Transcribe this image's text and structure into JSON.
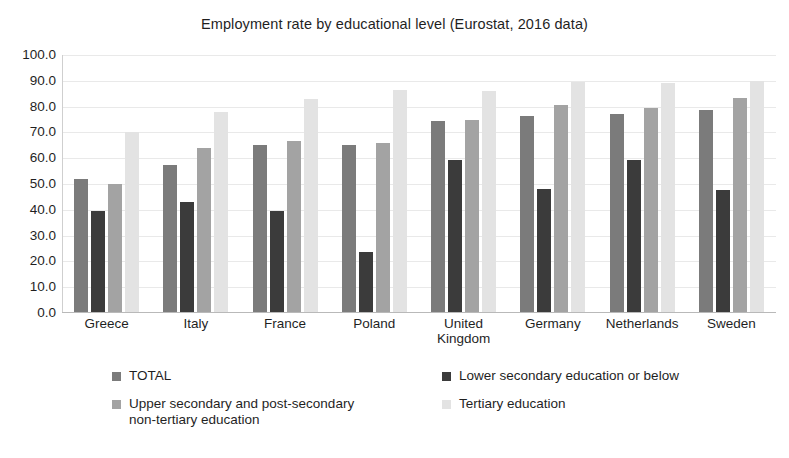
{
  "chart_data": {
    "type": "bar",
    "title": "Employment rate by educational level (Eurostat, 2016 data)",
    "xlabel": "",
    "ylabel": "",
    "ylim": [
      0,
      100
    ],
    "ytick_labels": [
      "100.0",
      "90.0",
      "80.0",
      "70.0",
      "60.0",
      "50.0",
      "40.0",
      "30.0",
      "20.0",
      "10.0",
      "0.0"
    ],
    "ytick_values": [
      100,
      90,
      80,
      70,
      60,
      50,
      40,
      30,
      20,
      10,
      0
    ],
    "grid": true,
    "legend_position": "bottom",
    "categories": [
      "Greece",
      "Italy",
      "France",
      "Poland",
      "United Kingdom",
      "Germany",
      "Netherlands",
      "Sweden"
    ],
    "category_lines": [
      [
        "Greece"
      ],
      [
        "Italy"
      ],
      [
        "France"
      ],
      [
        "Poland"
      ],
      [
        "United",
        "Kingdom"
      ],
      [
        "Germany"
      ],
      [
        "Netherlands"
      ],
      [
        "Sweden"
      ]
    ],
    "series": [
      {
        "name": "TOTAL",
        "color": "#7b7b7b",
        "values": [
          52.0,
          57.5,
          65.0,
          65.0,
          74.5,
          76.5,
          77.0,
          78.5
        ]
      },
      {
        "name": "Lower secondary education or below",
        "color": "#3b3b3b",
        "values": [
          39.5,
          43.0,
          39.5,
          23.5,
          59.5,
          48.0,
          59.5,
          47.5
        ]
      },
      {
        "name": "Upper secondary and post-secondary non-tertiary education",
        "color": "#a3a3a3",
        "values": [
          50.0,
          64.0,
          66.5,
          66.0,
          75.0,
          80.5,
          79.5,
          83.5
        ]
      },
      {
        "name": "Tertiary education",
        "color": "#e3e3e3",
        "values": [
          70.0,
          78.0,
          83.0,
          86.5,
          86.0,
          89.5,
          89.0,
          90.0
        ]
      }
    ]
  },
  "legend": {
    "entries": [
      {
        "label": "TOTAL",
        "color": "#7b7b7b"
      },
      {
        "label": "Lower secondary education or below",
        "color": "#3b3b3b"
      },
      {
        "label": "Upper secondary and post-secondary non-tertiary education",
        "color": "#a3a3a3"
      },
      {
        "label": "Tertiary education",
        "color": "#e3e3e3"
      }
    ],
    "entry_lines": [
      [
        "TOTAL"
      ],
      [
        "Lower secondary education or below"
      ],
      [
        "Upper secondary and post-secondary",
        "non-tertiary education"
      ],
      [
        "Tertiary education"
      ]
    ]
  }
}
